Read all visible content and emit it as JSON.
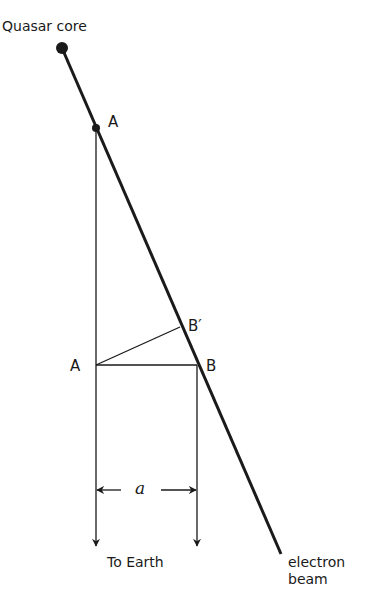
{
  "labels": {
    "quasar_core": "Quasar core",
    "point_a_top": "A",
    "point_a_mid": "A",
    "point_b": "B",
    "point_b_prime": "B′",
    "separation": "a",
    "to_earth": "To Earth",
    "electron_beam_line1": "electron",
    "electron_beam_line2": "beam"
  }
}
